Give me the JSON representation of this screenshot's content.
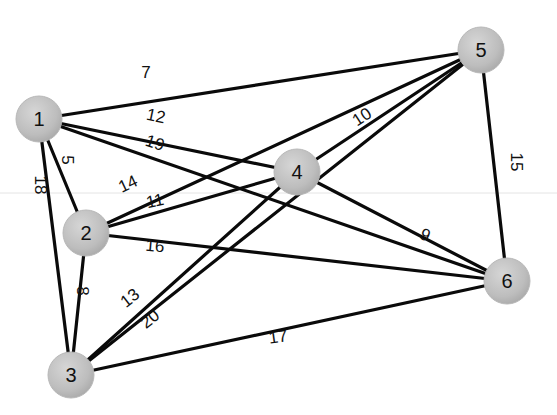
{
  "diagram": {
    "type": "weighted-undirected-graph",
    "node_fill": "#bdbdbd",
    "node_highlight": "#d6d6d6",
    "edge_color": "#0a0a0a",
    "nodes": [
      {
        "id": "1",
        "label": "1",
        "x": 39,
        "y": 119
      },
      {
        "id": "2",
        "label": "2",
        "x": 86,
        "y": 233
      },
      {
        "id": "3",
        "label": "3",
        "x": 71,
        "y": 375
      },
      {
        "id": "4",
        "label": "4",
        "x": 297,
        "y": 172
      },
      {
        "id": "5",
        "label": "5",
        "x": 481,
        "y": 50
      },
      {
        "id": "6",
        "label": "6",
        "x": 507,
        "y": 281
      }
    ],
    "edges": [
      {
        "from": "1",
        "to": "5",
        "weight": "7",
        "lx": 146,
        "ly": 72,
        "rot": 0
      },
      {
        "from": "1",
        "to": "4",
        "weight": "12",
        "lx": 156,
        "ly": 116,
        "rot": 12
      },
      {
        "from": "1",
        "to": "6",
        "weight": "19",
        "lx": 155,
        "ly": 143,
        "rot": 18
      },
      {
        "from": "1",
        "to": "2",
        "weight": "5",
        "lx": 67,
        "ly": 160,
        "rot": 90
      },
      {
        "from": "1",
        "to": "3",
        "weight": "18",
        "lx": 40,
        "ly": 185,
        "rot": 90
      },
      {
        "from": "2",
        "to": "5",
        "weight": "14",
        "lx": 128,
        "ly": 184,
        "rot": -25
      },
      {
        "from": "2",
        "to": "4",
        "weight": "11",
        "lx": 155,
        "ly": 201,
        "rot": -12
      },
      {
        "from": "2",
        "to": "6",
        "weight": "16",
        "lx": 155,
        "ly": 246,
        "rot": 5
      },
      {
        "from": "2",
        "to": "3",
        "weight": "8",
        "lx": 82,
        "ly": 291,
        "rot": 90
      },
      {
        "from": "3",
        "to": "4",
        "weight": "13",
        "lx": 130,
        "ly": 298,
        "rot": -38
      },
      {
        "from": "3",
        "to": "5",
        "weight": "20",
        "lx": 150,
        "ly": 319,
        "rot": -38
      },
      {
        "from": "3",
        "to": "6",
        "weight": "17",
        "lx": 278,
        "ly": 337,
        "rot": -8
      },
      {
        "from": "4",
        "to": "5",
        "weight": "10",
        "lx": 362,
        "ly": 117,
        "rot": -33
      },
      {
        "from": "4",
        "to": "6",
        "weight": "9",
        "lx": 425,
        "ly": 235,
        "rot": 25
      },
      {
        "from": "5",
        "to": "6",
        "weight": "15",
        "lx": 516,
        "ly": 162,
        "rot": 90
      }
    ]
  }
}
